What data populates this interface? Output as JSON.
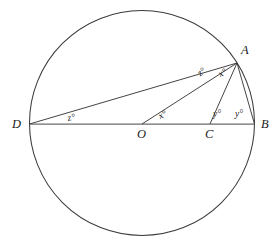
{
  "figure": {
    "type": "euclidean-geometry-diagram",
    "stroke_color": "#3a3a3a",
    "diameter_color": "#6b6b6b",
    "background_color": "#ffffff",
    "circle": {
      "cx": 142,
      "cy": 123,
      "r": 112.5
    },
    "points": [
      {
        "id": "A",
        "label": "A",
        "x": 237,
        "y": 63,
        "label_x": 241,
        "label_y": 44
      },
      {
        "id": "B",
        "label": "B",
        "x": 254.5,
        "y": 124,
        "label_x": 261,
        "label_y": 118
      },
      {
        "id": "C",
        "label": "C",
        "x": 210,
        "y": 124,
        "label_x": 205,
        "label_y": 128
      },
      {
        "id": "O",
        "label": "O",
        "x": 142,
        "y": 124,
        "label_x": 137,
        "label_y": 128
      },
      {
        "id": "D",
        "label": "D",
        "x": 29.5,
        "y": 124,
        "label_x": 12,
        "label_y": 118
      }
    ],
    "segments": [
      {
        "id": "DB",
        "from": "D",
        "to": "B",
        "kind": "diameter"
      },
      {
        "id": "DA",
        "from": "D",
        "to": "A",
        "kind": "chord"
      },
      {
        "id": "OA",
        "from": "O",
        "to": "A",
        "kind": "radius"
      },
      {
        "id": "CA",
        "from": "C",
        "to": "A",
        "kind": "cevian"
      },
      {
        "id": "BA",
        "from": "B",
        "to": "A",
        "kind": "chord"
      }
    ],
    "angle_labels": [
      {
        "id": "z-at-D",
        "text": "z°",
        "x": 67,
        "y": 114,
        "rotate": -9
      },
      {
        "id": "z-at-A",
        "text": "z°",
        "x": 196,
        "y": 71,
        "rotate": -38
      },
      {
        "id": "x-at-O",
        "text": "x°",
        "x": 157,
        "y": 113,
        "rotate": -28
      },
      {
        "id": "x-at-A",
        "text": "x°",
        "x": 217,
        "y": 71,
        "rotate": -28
      },
      {
        "id": "y-at-C",
        "text": "y°",
        "x": 213,
        "y": 110,
        "rotate": 0
      },
      {
        "id": "y-at-B",
        "text": "y°",
        "x": 235,
        "y": 110,
        "rotate": 0
      }
    ]
  }
}
